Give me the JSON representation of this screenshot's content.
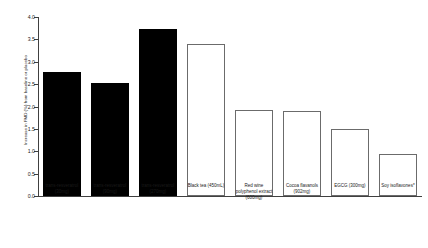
{
  "chart_data": {
    "type": "bar",
    "title": "",
    "xlabel": "",
    "ylabel": "Increase in FMD (%) from baseline or placebo",
    "ylim": [
      0.0,
      4.0
    ],
    "ytick_labels": [
      "0.0",
      "0.5",
      "1.0",
      "1.5",
      "2.0",
      "2.5",
      "3.0",
      "3.5",
      "4.0"
    ],
    "ytick_values": [
      0.0,
      0.5,
      1.0,
      1.5,
      2.0,
      2.5,
      3.0,
      3.5,
      4.0
    ],
    "grid": false,
    "legend": "none",
    "categories": [
      "trans-resveratrol\n(30mg)",
      "trans-resveratrol\n(90mg)",
      "trans-resveratrol\n(270mg)",
      "Black tea (450mL)",
      "Red wine\npolyphenol extract\n(600mg)",
      "Cocoa flavanols\n(902mg)",
      "EGCG (300mg)",
      "Soy isoflavones*"
    ],
    "values": [
      2.77,
      2.52,
      3.73,
      3.39,
      1.92,
      1.9,
      1.5,
      0.93
    ],
    "bar_styles": [
      "solid",
      "solid",
      "solid",
      "hollow",
      "hollow",
      "hollow",
      "hollow",
      "hollow"
    ],
    "colors": {
      "solid_fill": "#000000",
      "hollow_fill": "#ffffff",
      "hollow_edge": "#6b6b6b",
      "axis": "#404040",
      "text": "#1a1a1a",
      "background": "#ffffff"
    }
  }
}
